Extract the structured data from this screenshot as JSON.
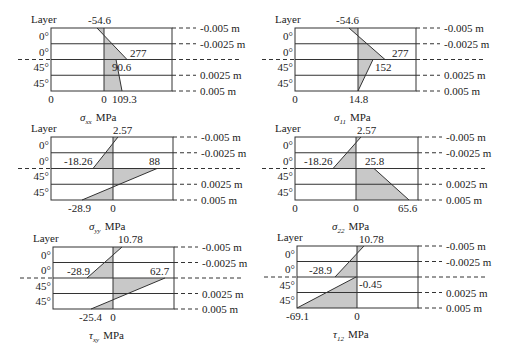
{
  "figure": {
    "layer_header": "Layer",
    "unit_label": "MPa",
    "fill_color": "#c8c8c8",
    "line_color": "#333333",
    "z_labels": [
      "-0.005 m",
      "-0.0025 m",
      "",
      "0.0025 m",
      "0.005 m"
    ],
    "layer_labels": [
      "0°",
      "0°",
      "45°",
      "45°"
    ]
  },
  "panels": [
    {
      "id": "sigma-xx",
      "symbol": "σ",
      "subscript": "xx",
      "box": {
        "left": 51,
        "top": 28,
        "right": 172,
        "bottom": 91
      },
      "zero_x": 104,
      "show_left_zero": true,
      "left_zero_label": "0",
      "zero_label": "0",
      "profile": [
        {
          "z": -0.005,
          "v": -54.6,
          "x": 97
        },
        {
          "z": 0.0,
          "v": 277,
          "x": 127
        },
        {
          "z": 0.0,
          "v": 90.6,
          "x": 116
        },
        {
          "z": 0.005,
          "v": 109.3,
          "x": 122
        }
      ],
      "labels": [
        {
          "text": "-54.6",
          "x": 88,
          "y": 24
        },
        {
          "text": "277",
          "x": 130,
          "y": 57
        },
        {
          "text": "90.6",
          "x": 112,
          "y": 71
        },
        {
          "text": "109.3",
          "x": 112,
          "y": 103
        }
      ]
    },
    {
      "id": "sigma-11",
      "symbol": "σ",
      "subscript": "11",
      "box": {
        "left": 295,
        "top": 28,
        "right": 416,
        "bottom": 91
      },
      "zero_x": 358,
      "show_left_zero": true,
      "left_zero_label": "0",
      "zero_label": "",
      "profile": [
        {
          "z": -0.005,
          "v": -54.6,
          "x": 349
        },
        {
          "z": 0.0,
          "v": 277,
          "x": 385
        },
        {
          "z": 0.0,
          "v": 152,
          "x": 373
        },
        {
          "z": 0.005,
          "v": 14.8,
          "x": 358
        }
      ],
      "labels": [
        {
          "text": "-54.6",
          "x": 336,
          "y": 24
        },
        {
          "text": "277",
          "x": 392,
          "y": 57
        },
        {
          "text": "152",
          "x": 375,
          "y": 71
        },
        {
          "text": "14.8",
          "x": 349,
          "y": 103
        }
      ]
    },
    {
      "id": "sigma-yy",
      "symbol": "σ",
      "subscript": "yy",
      "box": {
        "left": 51,
        "top": 137,
        "right": 173,
        "bottom": 200
      },
      "zero_x": 113,
      "show_left_zero": false,
      "left_zero_label": "",
      "zero_label": "0",
      "profile": [
        {
          "z": -0.005,
          "v": 2.57,
          "x": 118
        },
        {
          "z": 0.0,
          "v": -18.26,
          "x": 93
        },
        {
          "z": 0.0,
          "v": 88,
          "x": 157
        },
        {
          "z": 0.005,
          "v": -28.9,
          "x": 82
        }
      ],
      "labels": [
        {
          "text": "2.57",
          "x": 113,
          "y": 134
        },
        {
          "text": "-18.26",
          "x": 64,
          "y": 165
        },
        {
          "text": "88",
          "x": 149,
          "y": 165
        },
        {
          "text": "-28.9",
          "x": 68,
          "y": 212
        }
      ]
    },
    {
      "id": "sigma-22",
      "symbol": "σ",
      "subscript": "22",
      "box": {
        "left": 295,
        "top": 137,
        "right": 418,
        "bottom": 200
      },
      "zero_x": 356,
      "show_left_zero": true,
      "left_zero_label": "0",
      "zero_label": "0",
      "profile": [
        {
          "z": -0.005,
          "v": 2.57,
          "x": 361
        },
        {
          "z": 0.0,
          "v": -18.26,
          "x": 333
        },
        {
          "z": 0.0,
          "v": 25.8,
          "x": 374
        },
        {
          "z": 0.005,
          "v": 65.6,
          "x": 409
        }
      ],
      "labels": [
        {
          "text": "2.57",
          "x": 357,
          "y": 134
        },
        {
          "text": "-18.26",
          "x": 304,
          "y": 165
        },
        {
          "text": "25.8",
          "x": 365,
          "y": 165
        },
        {
          "text": "65.6",
          "x": 398,
          "y": 212
        }
      ]
    },
    {
      "id": "tau-xy",
      "symbol": "τ",
      "subscript": "xy",
      "box": {
        "left": 53,
        "top": 247,
        "right": 174,
        "bottom": 309
      },
      "zero_x": 113,
      "show_left_zero": false,
      "left_zero_label": "",
      "zero_label": "0",
      "profile": [
        {
          "z": -0.005,
          "v": 10.78,
          "x": 122
        },
        {
          "z": 0.0,
          "v": -28.9,
          "x": 87
        },
        {
          "z": 0.0,
          "v": 62.7,
          "x": 165
        },
        {
          "z": 0.005,
          "v": -25.4,
          "x": 91
        }
      ],
      "labels": [
        {
          "text": "10.78",
          "x": 118,
          "y": 243
        },
        {
          "text": "-28.9",
          "x": 67,
          "y": 275
        },
        {
          "text": "62.7",
          "x": 150,
          "y": 275
        },
        {
          "text": "-25.4",
          "x": 79,
          "y": 321
        }
      ]
    },
    {
      "id": "tau-12",
      "symbol": "τ",
      "subscript": "12",
      "box": {
        "left": 297,
        "top": 246,
        "right": 418,
        "bottom": 308
      },
      "zero_x": 357,
      "show_left_zero": false,
      "left_zero_label": "",
      "zero_label": "0",
      "profile": [
        {
          "z": -0.005,
          "v": 10.78,
          "x": 364
        },
        {
          "z": 0.0,
          "v": -28.9,
          "x": 335
        },
        {
          "z": 0.0,
          "v": -0.45,
          "x": 356
        },
        {
          "z": 0.005,
          "v": -69.1,
          "x": 297
        }
      ],
      "labels": [
        {
          "text": "10.78",
          "x": 359,
          "y": 243
        },
        {
          "text": "-28.9",
          "x": 309,
          "y": 274
        },
        {
          "text": "-0.45",
          "x": 359,
          "y": 288
        },
        {
          "text": "-69.1",
          "x": 286,
          "y": 320
        }
      ]
    }
  ]
}
